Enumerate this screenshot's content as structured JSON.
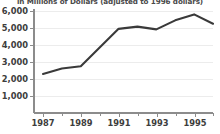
{
  "chart_data": {
    "type": "line",
    "title": "in Millions of Dollars (adjusted to 1996 dollars)",
    "xlabel": "",
    "ylabel": "",
    "x": [
      1987,
      1988,
      1989,
      1990,
      1991,
      1992,
      1993,
      1994,
      1995,
      1996
    ],
    "values": [
      2300,
      2620,
      2750,
      3850,
      4950,
      5080,
      4920,
      5450,
      5800,
      5250
    ],
    "series": [
      {
        "name": "Amount",
        "values": [
          2300,
          2620,
          2750,
          3850,
          4950,
          5080,
          4920,
          5450,
          5800,
          5250
        ]
      }
    ],
    "xlim": [
      1987,
      1996
    ],
    "ylim": [
      0,
      6000
    ],
    "ytick_labels": [
      "6,000",
      "5,000",
      "4,000",
      "3,000",
      "2,000",
      "1,000"
    ],
    "ytick_values": [
      6000,
      5000,
      4000,
      3000,
      2000,
      1000
    ],
    "xtick_labels": [
      "1987",
      "1989",
      "1991",
      "1993",
      "1995"
    ],
    "xtick_values": [
      1987,
      1989,
      1991,
      1993,
      1995
    ],
    "xtick_minor_values": [
      1988,
      1990,
      1992,
      1994,
      1996
    ],
    "grid": true,
    "legend": false,
    "line_color": "#3a3a3a",
    "grid_color": "#ececec",
    "axis_color": "#8c8c8c",
    "background_color": "#ffffff"
  }
}
